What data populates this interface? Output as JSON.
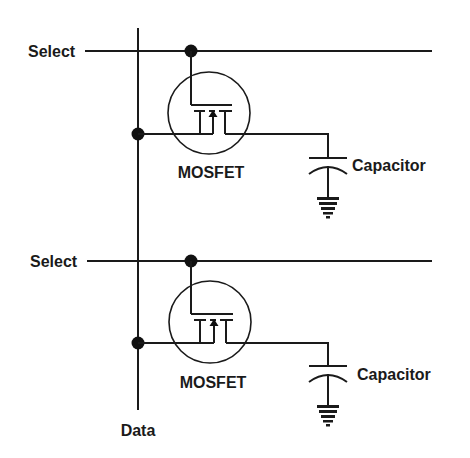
{
  "diagram": {
    "type": "DRAM memory cell array (1T1C)",
    "colors": {
      "ink": "#1a1a1a",
      "background": "#ffffff"
    },
    "data_line": {
      "label": "Data"
    },
    "cells": [
      {
        "select_label": "Select",
        "transistor_label": "MOSFET",
        "capacitor_label": "Capacitor"
      },
      {
        "select_label": "Select",
        "transistor_label": "MOSFET",
        "capacitor_label": "Capacitor"
      }
    ]
  }
}
